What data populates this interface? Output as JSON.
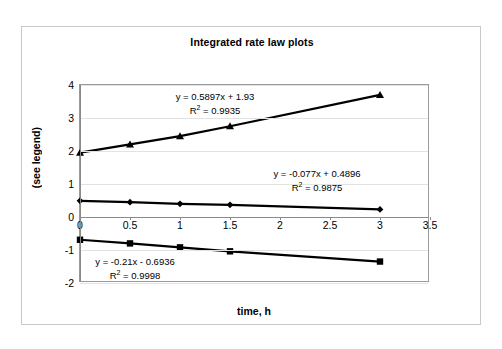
{
  "chart_data": {
    "type": "line",
    "title": "Integrated rate law plots",
    "xlabel": "time, h",
    "ylabel": "(see legend)",
    "xlim": [
      0,
      3.5
    ],
    "ylim": [
      -2,
      4
    ],
    "grid": true,
    "legend": "none",
    "x_ticks": [
      "0",
      "0.5",
      "1",
      "1.5",
      "2",
      "2.5",
      "3",
      "3.5"
    ],
    "x_tick_values": [
      0,
      0.5,
      1,
      1.5,
      2,
      2.5,
      3,
      3.5
    ],
    "y_ticks": [
      "4",
      "3",
      "2",
      "1",
      "0",
      "-1",
      "-2"
    ],
    "y_tick_values": [
      4,
      3,
      2,
      1,
      0,
      -1,
      -2
    ],
    "x": [
      0,
      0.5,
      1,
      1.5,
      3
    ],
    "series": [
      {
        "name": "triangle-series",
        "marker": "triangle",
        "values": [
          1.95,
          2.2,
          2.45,
          2.75,
          3.7
        ],
        "trendline": "y = 0.5897x + 1.93",
        "r_squared": "0.9935"
      },
      {
        "name": "diamond-series",
        "marker": "diamond",
        "values": [
          0.49,
          0.45,
          0.4,
          0.37,
          0.23
        ],
        "trendline": "y = -0.077x + 0.4896",
        "r_squared": "0.9875"
      },
      {
        "name": "square-series",
        "marker": "square",
        "values": [
          -0.69,
          -0.8,
          -0.92,
          -1.04,
          -1.35
        ],
        "trendline": "y = -0.21x - 0.6936",
        "r_squared": "0.9998"
      }
    ],
    "annotations": [
      {
        "id": "triangle",
        "equation": "y = 0.5897x + 1.93",
        "r2_prefix": "R",
        "r2_exp": "2",
        "r2_value": " = 0.9935"
      },
      {
        "id": "diamond",
        "equation": "y = -0.077x + 0.4896",
        "r2_prefix": "R",
        "r2_exp": "2",
        "r2_value": " = 0.9875"
      },
      {
        "id": "square",
        "equation": "y = -0.21x - 0.6936",
        "r2_prefix": "R",
        "r2_exp": "2",
        "r2_value": " = 0.9998"
      }
    ],
    "colors": {
      "series": "#000000",
      "grid": "#e2e2e2",
      "axis": "#8a8a8a",
      "frame": "#c9c9c9",
      "background": "#ffffff"
    }
  }
}
